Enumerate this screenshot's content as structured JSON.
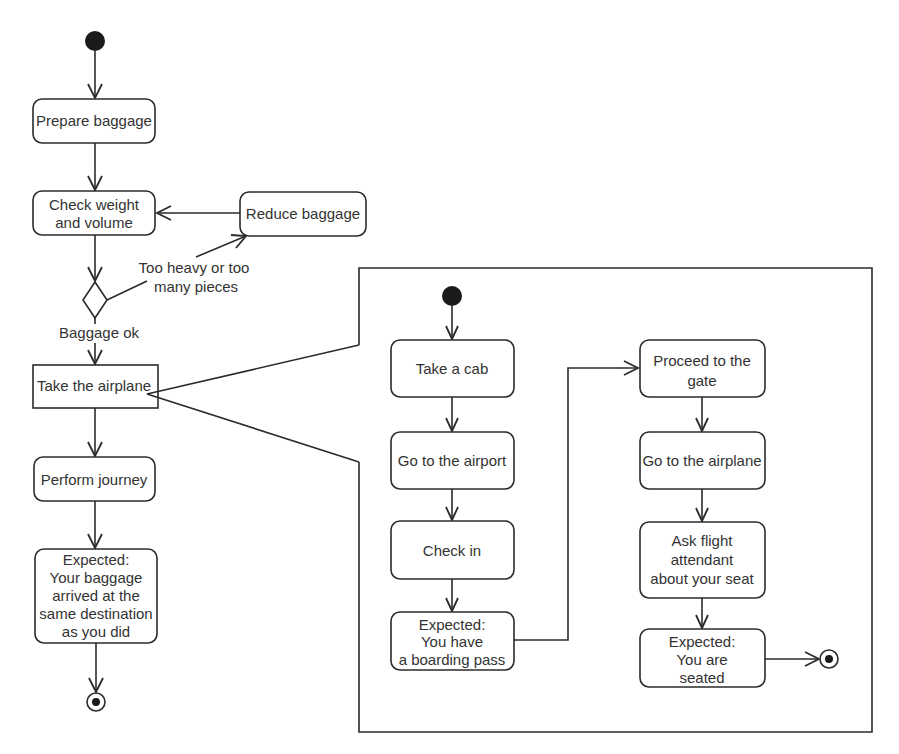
{
  "diagram": {
    "type": "uml-activity",
    "main_flow": {
      "nodes": [
        {
          "id": "prepare",
          "lines": [
            "Prepare baggage"
          ]
        },
        {
          "id": "check",
          "lines": [
            "Check weight",
            "and volume"
          ]
        },
        {
          "id": "reduce",
          "lines": [
            "Reduce baggage"
          ]
        },
        {
          "id": "take_airplane",
          "lines": [
            "Take the airplane"
          ]
        },
        {
          "id": "journey",
          "lines": [
            "Perform journey"
          ]
        },
        {
          "id": "expected_main",
          "lines": [
            "Expected:",
            "Your baggage",
            "arrived at the",
            "same destination",
            "as you did"
          ]
        }
      ],
      "decision_labels": {
        "reject": [
          "Too heavy or too",
          "many pieces"
        ],
        "accept": "Baggage ok"
      }
    },
    "sub_flow": {
      "nodes": [
        {
          "id": "cab",
          "lines": [
            "Take a cab"
          ]
        },
        {
          "id": "airport",
          "lines": [
            "Go to the airport"
          ]
        },
        {
          "id": "checkin",
          "lines": [
            "Check in"
          ]
        },
        {
          "id": "expected_pass",
          "lines": [
            "Expected:",
            "You have",
            "a boarding pass"
          ]
        },
        {
          "id": "gate",
          "lines": [
            "Proceed to the",
            "gate"
          ]
        },
        {
          "id": "goairplane",
          "lines": [
            "Go to the airplane"
          ]
        },
        {
          "id": "ask",
          "lines": [
            "Ask flight",
            "attendant",
            "about your seat"
          ]
        },
        {
          "id": "expected_seated",
          "lines": [
            "Expected:",
            "You are",
            "seated"
          ]
        }
      ]
    },
    "colors": {
      "stroke": "#2b2b2b",
      "text": "#333333",
      "background": "#ffffff"
    }
  }
}
